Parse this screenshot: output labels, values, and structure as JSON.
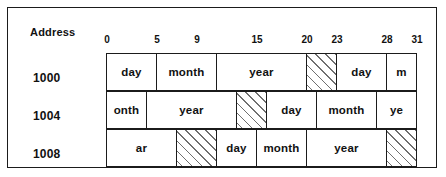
{
  "figure": {
    "address_caption": "Address",
    "addresses": [
      "1000",
      "1004",
      "1008"
    ],
    "bit_ruler": {
      "ticks": [
        {
          "label": "0",
          "bit": 0
        },
        {
          "label": "5",
          "bit": 5
        },
        {
          "label": "9",
          "bit": 9
        },
        {
          "label": "15",
          "bit": 15
        },
        {
          "label": "20",
          "bit": 20
        },
        {
          "label": "23",
          "bit": 23
        },
        {
          "label": "28",
          "bit": 28
        },
        {
          "label": "31",
          "bit": 31
        }
      ],
      "range": [
        0,
        31
      ]
    },
    "rows": [
      {
        "address": "1000",
        "fields": [
          {
            "label": "day",
            "start": 0,
            "end": 5,
            "padding": false
          },
          {
            "label": "month",
            "start": 5,
            "end": 11,
            "padding": false
          },
          {
            "label": "year",
            "start": 11,
            "end": 20,
            "padding": false
          },
          {
            "label": "",
            "start": 20,
            "end": 23,
            "padding": true
          },
          {
            "label": "day",
            "start": 23,
            "end": 28,
            "padding": false
          },
          {
            "label": "m",
            "start": 28,
            "end": 31,
            "padding": false
          }
        ]
      },
      {
        "address": "1004",
        "fields": [
          {
            "label": "onth",
            "start": 0,
            "end": 4,
            "padding": false
          },
          {
            "label": "year",
            "start": 4,
            "end": 13,
            "padding": false
          },
          {
            "label": "",
            "start": 13,
            "end": 16,
            "padding": true
          },
          {
            "label": "day",
            "start": 16,
            "end": 21,
            "padding": false
          },
          {
            "label": "month",
            "start": 21,
            "end": 27,
            "padding": false
          },
          {
            "label": "ye",
            "start": 27,
            "end": 31,
            "padding": false
          }
        ]
      },
      {
        "address": "1008",
        "fields": [
          {
            "label": "ar",
            "start": 0,
            "end": 7,
            "padding": false
          },
          {
            "label": "",
            "start": 7,
            "end": 11,
            "padding": true
          },
          {
            "label": "day",
            "start": 11,
            "end": 15,
            "padding": false
          },
          {
            "label": "month",
            "start": 15,
            "end": 20,
            "padding": false
          },
          {
            "label": "year",
            "start": 20,
            "end": 28,
            "padding": false
          },
          {
            "label": "",
            "start": 28,
            "end": 31,
            "padding": true
          }
        ]
      }
    ],
    "colors": {
      "ink": "#1b1b1b",
      "background": "#ffffff",
      "hatch": "#6f6f6f"
    }
  }
}
